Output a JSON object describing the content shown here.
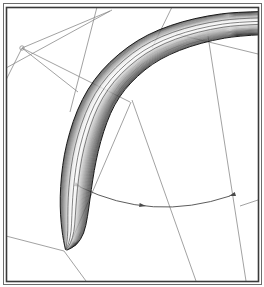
{
  "figure": {
    "title": "",
    "kind": "cad-shaded-wireframe-view",
    "width": 264,
    "height": 287,
    "background_color": "#ffffff"
  },
  "frame": {
    "outer_border_color": "#6d6d6d",
    "inner_border_color": "#3a3a3a",
    "outer_rect": {
      "x": 3,
      "y": 3,
      "width": 258,
      "height": 281
    },
    "inner_rect": {
      "x": 6,
      "y": 7,
      "width": 252,
      "height": 274
    },
    "outer_stroke_width": 1,
    "inner_stroke_width": 1.6
  },
  "wireframe": {
    "line_color": "#8a8a8a",
    "line_width": 0.8,
    "segments": [
      {
        "name": "upper-left-long-chord",
        "points": [
          [
            6,
            68
          ],
          [
            112,
            10
          ]
        ]
      },
      {
        "name": "vertex-spoke-up",
        "points": [
          [
            22,
            48
          ],
          [
            110,
            11
          ]
        ]
      },
      {
        "name": "vertex-spoke-down-left",
        "points": [
          [
            22,
            48
          ],
          [
            6,
            80
          ]
        ]
      },
      {
        "name": "vertex-spoke-down-right",
        "points": [
          [
            22,
            48
          ],
          [
            78,
            92
          ]
        ]
      },
      {
        "name": "vertex-to-right-chord",
        "points": [
          [
            22,
            48
          ],
          [
            130,
            102
          ]
        ]
      },
      {
        "name": "top-vertical-rail-a",
        "points": [
          [
            97,
            7
          ],
          [
            70,
            112
          ]
        ]
      },
      {
        "name": "top-vertical-rail-b",
        "points": [
          [
            172,
            7
          ],
          [
            152,
            48
          ]
        ]
      },
      {
        "name": "mid-diagonal-rail",
        "points": [
          [
            131,
            102
          ],
          [
            68,
            249
          ]
        ]
      },
      {
        "name": "mid-diagonal-rail-2",
        "points": [
          [
            132,
            100
          ],
          [
            196,
            281
          ]
        ]
      },
      {
        "name": "right-vertical-rail",
        "points": [
          [
            208,
            36
          ],
          [
            246,
            281
          ]
        ]
      },
      {
        "name": "right-chord-top",
        "points": [
          [
            176,
            34
          ],
          [
            258,
            54
          ]
        ]
      },
      {
        "name": "lower-left-edge",
        "points": [
          [
            6,
            236
          ],
          [
            64,
            251
          ]
        ]
      },
      {
        "name": "tip-spoke-down",
        "points": [
          [
            64,
            251
          ],
          [
            86,
            281
          ]
        ]
      },
      {
        "name": "right-lower-edge",
        "points": [
          [
            240,
            206
          ],
          [
            258,
            200
          ]
        ]
      }
    ]
  },
  "dimension_arc": {
    "name": "angular-dimension",
    "color": "#4a4a4a",
    "line_width": 0.9,
    "start_point": [
      80,
      187
    ],
    "control_point": [
      152,
      222
    ],
    "end_point": [
      230,
      196
    ],
    "arrowheads": [
      {
        "name": "arc-start-arrowhead",
        "at": [
          81,
          187
        ],
        "angle_deg": 205
      },
      {
        "name": "arc-middle-arrowhead",
        "at": [
          146,
          206
        ],
        "angle_deg": 188
      },
      {
        "name": "arc-end-arrowhead",
        "at": [
          229,
          196
        ],
        "angle_deg": 342
      }
    ]
  },
  "solid": {
    "name": "curved-blade-tube",
    "outline_color": "#1a1a1a",
    "shading": {
      "dark_edge": "#3b3b3b",
      "mid_tone": "#9e9e9e",
      "highlight": "#fafafa",
      "shadow_band": "#606060"
    },
    "ridge_line_color": "#4f4f4f",
    "outer_path": "M 258 12 L 196 18 L 150 32 L 112 54 L 86 82 L 70 112 L 60 150 L 55 190 L 57 224 L 64 251 L 75 236 L 86 208 L 94 176 L 100 142 L 110 110 L 128 82 L 152 60 L 182 45 L 214 37 L 258 34 Z",
    "ridges": [
      "M 258 20 L 198 26 L 156 40 L 122 62 L 98 90 L 84 122 L 75 160 L 70 198 L 70 232 L 66 249",
      "M 258 26 L 202 32 L 162 46 L 130 68 L 108 96 L 95 128 L 87 164 L 83 200 L 82 230 L 66 249",
      "M 258 30 L 208 35 L 172 48 L 142 70 L 120 98 L 107 130 L 99 166 L 95 202 L 93 228 L 66 249"
    ]
  },
  "legend": {
    "entries": []
  }
}
